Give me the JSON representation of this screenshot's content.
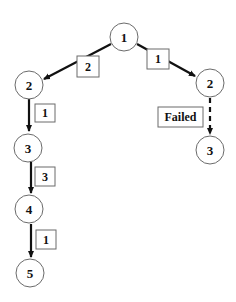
{
  "diagram": {
    "type": "tree",
    "nodes": [
      {
        "id": "n1",
        "label": "1",
        "x": 124,
        "y": 37
      },
      {
        "id": "nL2",
        "label": "2",
        "x": 29,
        "y": 85
      },
      {
        "id": "nL3",
        "label": "3",
        "x": 28,
        "y": 148
      },
      {
        "id": "nL4",
        "label": "4",
        "x": 29,
        "y": 209
      },
      {
        "id": "nL5",
        "label": "5",
        "x": 30,
        "y": 273
      },
      {
        "id": "nR2",
        "label": "2",
        "x": 210,
        "y": 83
      },
      {
        "id": "nR3",
        "label": "3",
        "x": 210,
        "y": 150
      }
    ],
    "edges": [
      {
        "from": "n1",
        "to": "nL2",
        "weight": "2",
        "style": "solid"
      },
      {
        "from": "n1",
        "to": "nR2",
        "weight": "1",
        "style": "solid"
      },
      {
        "from": "nL2",
        "to": "nL3",
        "weight": "1",
        "style": "solid"
      },
      {
        "from": "nL3",
        "to": "nL4",
        "weight": "3",
        "style": "solid"
      },
      {
        "from": "nL4",
        "to": "nL5",
        "weight": "1",
        "style": "solid"
      },
      {
        "from": "nR2",
        "to": "nR3",
        "label": "Failed",
        "style": "dashed"
      }
    ],
    "labels": {
      "root": "1",
      "left_2": "2",
      "left_3": "3",
      "left_4": "4",
      "left_5": "5",
      "right_2": "2",
      "right_3": "3",
      "w_root_left": "2",
      "w_root_right": "1",
      "w_l2_l3": "1",
      "w_l3_l4": "3",
      "w_l4_l5": "1",
      "failed": "Failed"
    }
  }
}
